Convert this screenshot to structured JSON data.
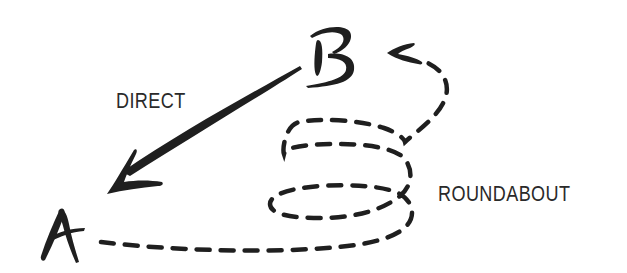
{
  "diagram": {
    "nodes": [
      {
        "id": "A",
        "label": "A"
      },
      {
        "id": "B",
        "label": "B"
      }
    ],
    "edges": [
      {
        "from": "B",
        "to": "A",
        "label": "DIRECT",
        "style": "solid-arrow"
      },
      {
        "from": "A",
        "to": "B",
        "label": "ROUNDABOUT",
        "style": "dashed-spiral-arrow"
      }
    ],
    "labels": {
      "direct": "DIRECT",
      "roundabout": "ROUNDABOUT"
    },
    "colors": {
      "ink": "#1f1f1f",
      "text": "#2a2a2a",
      "background": "#ffffff"
    }
  }
}
